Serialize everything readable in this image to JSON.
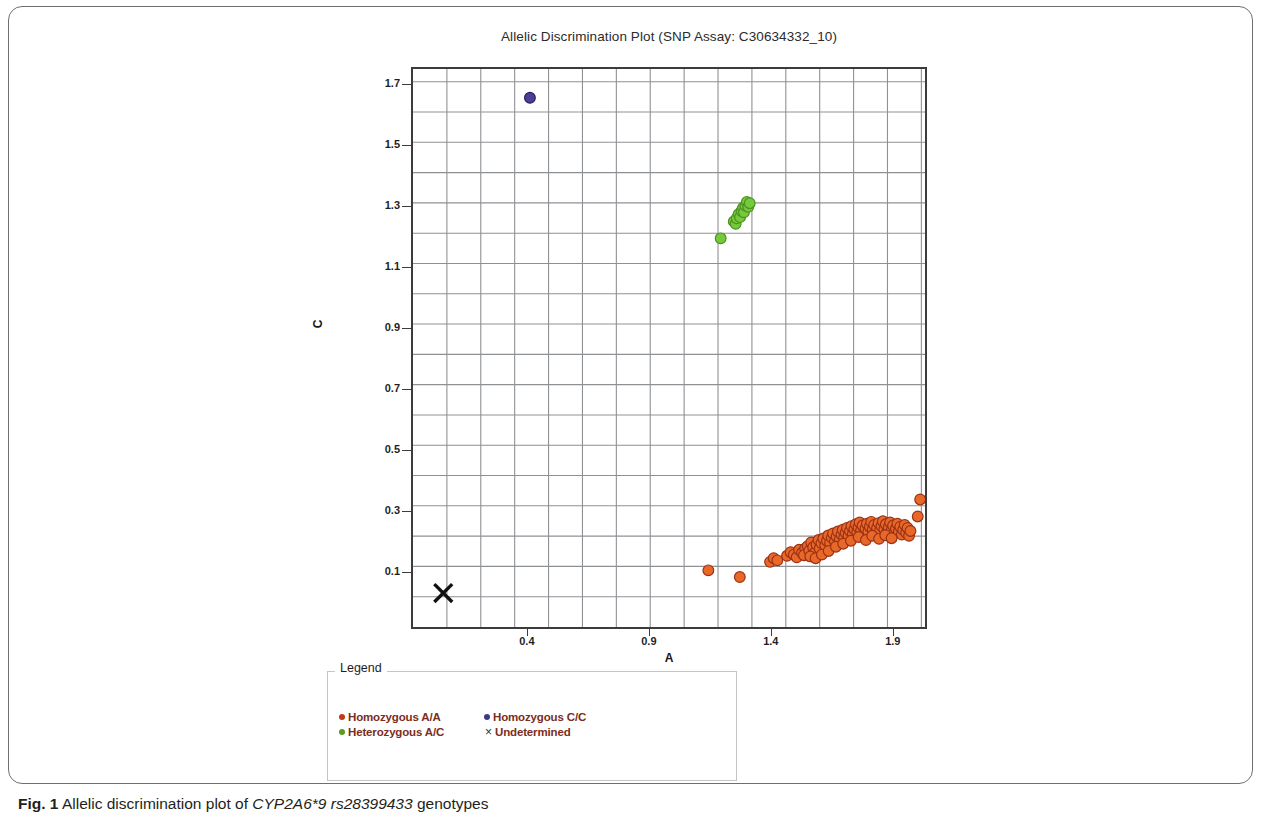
{
  "figure": {
    "caption_prefix": "Fig. 1",
    "caption_text_1": " Allelic discrimination plot of ",
    "caption_gene": "CYP2A6*9 rs28399433",
    "caption_text_2": " genotypes"
  },
  "chart_data": {
    "type": "scatter",
    "title": "Allelic Discrimination Plot (SNP Assay: C30634332_10)",
    "xlabel": "A",
    "ylabel": "C",
    "xlim": [
      -0.075,
      2.04
    ],
    "ylim": [
      -0.087,
      1.755
    ],
    "xticks": [
      "0.4",
      "0.9",
      "1.4",
      "1.9"
    ],
    "xtick_values": [
      0.4,
      0.9,
      1.4,
      1.9
    ],
    "yticks": [
      "0.1",
      "0.3",
      "0.5",
      "0.7",
      "0.9",
      "1.1",
      "1.3",
      "1.5",
      "1.7"
    ],
    "ytick_values": [
      0.1,
      0.3,
      0.5,
      0.7,
      0.9,
      1.1,
      1.3,
      1.5,
      1.7
    ],
    "grid": true,
    "grid_step_x": 0.14,
    "grid_step_y": 0.1,
    "legend_position": "below-plot",
    "colors": {
      "homozygous_aa": "#e8682a",
      "homozygous_aa_edge": "#9c3114",
      "heterozygous_ac": "#74c93c",
      "heterozygous_ac_edge": "#4d9120",
      "homozygous_cc": "#4a3f96",
      "homozygous_cc_edge": "#2a2160",
      "undetermined": "#111111",
      "grid": "#8e9194",
      "axis": "#3c3c3c"
    },
    "series": [
      {
        "name": "Homozygous A/A",
        "marker": "circle",
        "color": "#e8682a",
        "edge_color": "#9c3114",
        "count": 96,
        "points": [
          [
            1.145,
            0.1
          ],
          [
            1.275,
            0.078
          ],
          [
            1.4,
            0.128
          ],
          [
            1.415,
            0.14
          ],
          [
            1.43,
            0.133
          ],
          [
            1.47,
            0.148
          ],
          [
            1.485,
            0.16
          ],
          [
            1.498,
            0.152
          ],
          [
            1.51,
            0.143
          ],
          [
            1.52,
            0.168
          ],
          [
            1.532,
            0.158
          ],
          [
            1.545,
            0.172
          ],
          [
            1.54,
            0.15
          ],
          [
            1.555,
            0.18
          ],
          [
            1.562,
            0.165
          ],
          [
            1.57,
            0.192
          ],
          [
            1.578,
            0.176
          ],
          [
            1.585,
            0.158
          ],
          [
            1.592,
            0.185
          ],
          [
            1.6,
            0.2
          ],
          [
            1.605,
            0.172
          ],
          [
            1.612,
            0.19
          ],
          [
            1.62,
            0.205
          ],
          [
            1.628,
            0.182
          ],
          [
            1.635,
            0.198
          ],
          [
            1.64,
            0.215
          ],
          [
            1.648,
            0.19
          ],
          [
            1.655,
            0.208
          ],
          [
            1.66,
            0.222
          ],
          [
            1.668,
            0.196
          ],
          [
            1.675,
            0.212
          ],
          [
            1.68,
            0.228
          ],
          [
            1.688,
            0.202
          ],
          [
            1.695,
            0.218
          ],
          [
            1.7,
            0.234
          ],
          [
            1.706,
            0.208
          ],
          [
            1.712,
            0.224
          ],
          [
            1.718,
            0.24
          ],
          [
            1.724,
            0.214
          ],
          [
            1.73,
            0.23
          ],
          [
            1.736,
            0.246
          ],
          [
            1.742,
            0.22
          ],
          [
            1.748,
            0.236
          ],
          [
            1.754,
            0.252
          ],
          [
            1.76,
            0.226
          ],
          [
            1.765,
            0.242
          ],
          [
            1.77,
            0.258
          ],
          [
            1.776,
            0.232
          ],
          [
            1.782,
            0.248
          ],
          [
            1.788,
            0.222
          ],
          [
            1.794,
            0.238
          ],
          [
            1.8,
            0.254
          ],
          [
            1.806,
            0.228
          ],
          [
            1.812,
            0.244
          ],
          [
            1.818,
            0.26
          ],
          [
            1.824,
            0.234
          ],
          [
            1.83,
            0.25
          ],
          [
            1.836,
            0.224
          ],
          [
            1.842,
            0.24
          ],
          [
            1.848,
            0.256
          ],
          [
            1.854,
            0.23
          ],
          [
            1.86,
            0.246
          ],
          [
            1.866,
            0.262
          ],
          [
            1.872,
            0.236
          ],
          [
            1.878,
            0.252
          ],
          [
            1.884,
            0.226
          ],
          [
            1.89,
            0.242
          ],
          [
            1.896,
            0.258
          ],
          [
            1.902,
            0.232
          ],
          [
            1.908,
            0.248
          ],
          [
            1.914,
            0.222
          ],
          [
            1.92,
            0.238
          ],
          [
            1.926,
            0.254
          ],
          [
            1.932,
            0.228
          ],
          [
            1.938,
            0.244
          ],
          [
            1.944,
            0.218
          ],
          [
            1.95,
            0.234
          ],
          [
            1.956,
            0.25
          ],
          [
            1.962,
            0.224
          ],
          [
            1.968,
            0.24
          ],
          [
            1.974,
            0.214
          ],
          [
            1.98,
            0.23
          ],
          [
            1.566,
            0.146
          ],
          [
            1.588,
            0.14
          ],
          [
            1.614,
            0.152
          ],
          [
            1.642,
            0.164
          ],
          [
            1.672,
            0.178
          ],
          [
            1.702,
            0.188
          ],
          [
            1.734,
            0.198
          ],
          [
            1.766,
            0.21
          ],
          [
            1.796,
            0.2
          ],
          [
            1.822,
            0.214
          ],
          [
            1.85,
            0.204
          ],
          [
            1.876,
            0.216
          ],
          [
            1.902,
            0.206
          ],
          [
            2.01,
            0.278
          ],
          [
            2.02,
            0.334
          ]
        ]
      },
      {
        "name": "Heterozygous A/C",
        "marker": "circle",
        "color": "#74c93c",
        "edge_color": "#4d9120",
        "count": 13,
        "points": [
          [
            1.196,
            1.196
          ],
          [
            1.25,
            1.252
          ],
          [
            1.258,
            1.244
          ],
          [
            1.262,
            1.262
          ],
          [
            1.27,
            1.276
          ],
          [
            1.276,
            1.266
          ],
          [
            1.282,
            1.286
          ],
          [
            1.288,
            1.296
          ],
          [
            1.292,
            1.282
          ],
          [
            1.298,
            1.304
          ],
          [
            1.304,
            1.316
          ],
          [
            1.31,
            1.3
          ],
          [
            1.316,
            1.312
          ]
        ]
      },
      {
        "name": "Homozygous C/C",
        "marker": "circle",
        "color": "#4a3f96",
        "edge_color": "#2a2160",
        "count": 1,
        "points": [
          [
            0.408,
            1.66
          ]
        ]
      },
      {
        "name": "Undetermined",
        "marker": "x",
        "color": "#111111",
        "count": 1,
        "points": [
          [
            0.05,
            0.025
          ]
        ]
      }
    ]
  },
  "legend": {
    "title": "Legend",
    "items": [
      {
        "label": "Homozygous A/A",
        "marker": "circle",
        "color": "#c0391c"
      },
      {
        "label": "Homozygous C/C",
        "marker": "circle",
        "color": "#3f3a86"
      },
      {
        "label": "Heterozygous A/C",
        "marker": "circle",
        "color": "#5b9a23"
      },
      {
        "label": "Undetermined",
        "marker": "x",
        "color": "#222222"
      }
    ]
  }
}
